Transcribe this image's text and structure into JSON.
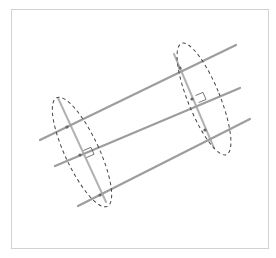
{
  "diagram": {
    "title": "",
    "colors": {
      "frame": "#d2d2d2",
      "line": "#8a8a8a",
      "transversal": "#9a9a9a",
      "ellipse": "#444444",
      "right_angle": "#555555"
    },
    "parallel_lines": [
      {
        "x1": 40,
        "y1": 140,
        "x2": 236,
        "y2": 45
      },
      {
        "x1": 55,
        "y1": 166,
        "x2": 240,
        "y2": 88
      },
      {
        "x1": 78,
        "y1": 206,
        "x2": 250,
        "y2": 119
      }
    ],
    "transversals": [
      {
        "x1": 58,
        "y1": 98,
        "x2": 106,
        "y2": 202
      },
      {
        "x1": 174,
        "y1": 54,
        "x2": 214,
        "y2": 148
      }
    ],
    "ellipses": [
      {
        "cx": 82,
        "cy": 150,
        "rx": 18,
        "ry": 60,
        "rotate": -25
      },
      {
        "cx": 203,
        "cy": 98,
        "rx": 17,
        "ry": 60,
        "rotate": -22
      }
    ],
    "right_angle_markers": [
      {
        "x": 86,
        "y": 155
      },
      {
        "x": 199,
        "y": 106
      }
    ]
  }
}
